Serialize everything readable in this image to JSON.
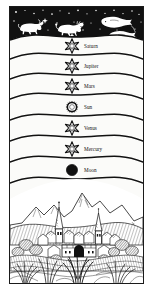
{
  "plate": {
    "title": "Geocentric cosmos woodcut",
    "border_color": "#1a1a1a",
    "paper_color": "#fbfbf9",
    "ink_color": "#111111"
  },
  "zodiac_band": {
    "name": "starry zodiac band",
    "background_color": "#111111",
    "star_color": "#ffffff",
    "figures": [
      {
        "sign": "Taurus",
        "depicts": "bull-figure"
      },
      {
        "sign": "Leo",
        "depicts": "lion-figure"
      },
      {
        "sign": "Pisces",
        "depicts": "two-fishes-figure"
      }
    ]
  },
  "spheres": [
    {
      "label": "Saturn",
      "symbol": "six-pointed-star-icon",
      "symbol_type": "star"
    },
    {
      "label": "Jupiter",
      "symbol": "six-pointed-star-icon",
      "symbol_type": "star"
    },
    {
      "label": "Mars",
      "symbol": "six-pointed-star-icon",
      "symbol_type": "star"
    },
    {
      "label": "Sun",
      "symbol": "radiant-sun-icon",
      "symbol_type": "sun"
    },
    {
      "label": "Venus",
      "symbol": "six-pointed-star-icon",
      "symbol_type": "star"
    },
    {
      "label": "Mercury",
      "symbol": "six-pointed-star-icon",
      "symbol_type": "star"
    },
    {
      "label": "Moon",
      "symbol": "crescent-moon-icon",
      "symbol_type": "moon"
    }
  ],
  "landscape": {
    "name": "earthly landscape",
    "elements": [
      "mountain-range",
      "walled-town",
      "church-spire-left",
      "church-spire-right",
      "town-gate",
      "trees",
      "foreground-grass"
    ]
  }
}
